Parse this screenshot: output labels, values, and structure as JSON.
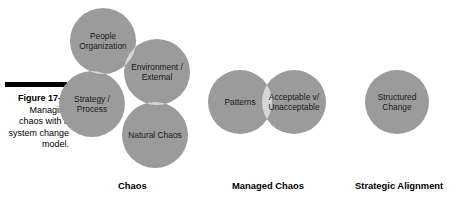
{
  "figure": {
    "caption_label": "Figure 17-1:",
    "caption_body": "Managing chaos with a system change model."
  },
  "colors": {
    "circle_fill": "#9b9b9b",
    "overlap_fill": "#d6d6d6",
    "overlap_fill_deep": "#e4e4e4",
    "label_text": "#1a1a1a",
    "caption_rule": "#000000",
    "background": "#ffffff"
  },
  "groups": [
    {
      "id": "chaos",
      "caption": "Chaos",
      "circles": [
        {
          "id": "people-organization",
          "label": "People\nOrganization",
          "cx": 103,
          "cy": 41,
          "r": 33
        },
        {
          "id": "environment-external",
          "label": "Environment /\nExternal",
          "cx": 157,
          "cy": 72,
          "r": 33
        },
        {
          "id": "strategy-process",
          "label": "Strategy /\nProcess",
          "cx": 92,
          "cy": 104,
          "r": 33
        },
        {
          "id": "natural-chaos",
          "label": "Natural Chaos",
          "cx": 155,
          "cy": 135,
          "r": 33
        }
      ]
    },
    {
      "id": "managed-chaos",
      "caption": "Managed Chaos",
      "circles": [
        {
          "id": "patterns",
          "label": "Patterns",
          "cx": 240,
          "cy": 102,
          "r": 32
        },
        {
          "id": "acceptable-unacceptable",
          "label": "Acceptable v/\nUnacceptable",
          "cx": 294,
          "cy": 102,
          "r": 32
        }
      ]
    },
    {
      "id": "strategic-alignment",
      "caption": "Strategic Alignment",
      "circles": [
        {
          "id": "structured-change",
          "label": "Structured\nChange",
          "cx": 397,
          "cy": 102,
          "r": 32
        }
      ]
    }
  ],
  "group_caption_positions": [
    {
      "id": "chaos",
      "left": 118
    },
    {
      "id": "managed-chaos",
      "left": 232
    },
    {
      "id": "strategic-alignment",
      "left": 355
    }
  ]
}
